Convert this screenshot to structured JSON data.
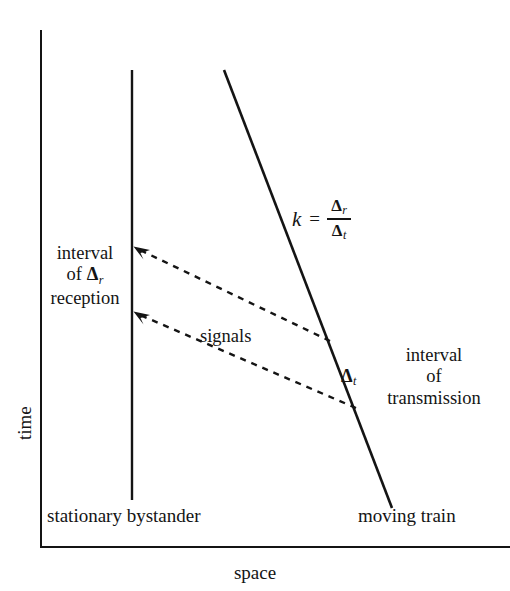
{
  "figure": {
    "kind": "spacetime-diagram"
  },
  "axes": {
    "y_title": "time",
    "x_title": "space",
    "color": "#141414"
  },
  "worldlines": {
    "bystander": {
      "caption": "stationary bystander",
      "style": "solid-vertical",
      "x1": 132,
      "y1": 70,
      "x2": 132,
      "y2": 500
    },
    "train": {
      "caption": "moving train",
      "style": "solid-slanted",
      "x1": 224,
      "y1": 70,
      "x2": 392,
      "y2": 508
    }
  },
  "signals": {
    "label": "signals",
    "style": "dashed",
    "upper": {
      "from_x": 330,
      "from_y": 341,
      "to_x": 136,
      "to_y": 248
    },
    "lower": {
      "from_x": 356,
      "from_y": 408,
      "to_x": 136,
      "to_y": 313
    }
  },
  "annotations": {
    "reception": {
      "line1": "interval",
      "line2": "of",
      "line3": "reception",
      "delta_symbol": "Δ",
      "delta_subscript": "r"
    },
    "transmission": {
      "line1": "interval",
      "line2": "of",
      "line3": "transmission",
      "delta_symbol": "Δ",
      "delta_subscript": "t"
    }
  },
  "formula": {
    "variable": "k",
    "equals": "=",
    "numerator_symbol": "Δ",
    "numerator_subscript": "r",
    "denominator_symbol": "Δ",
    "denominator_subscript": "t"
  }
}
